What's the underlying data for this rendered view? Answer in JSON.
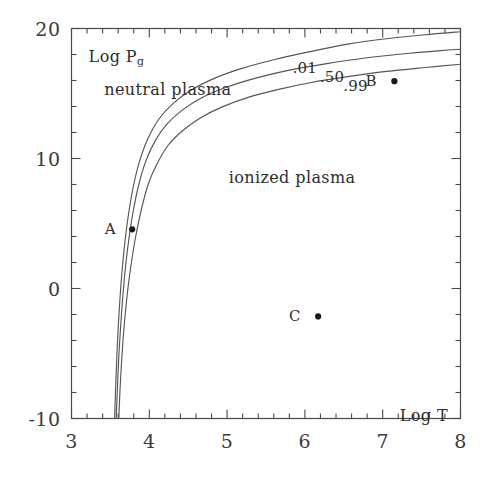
{
  "chart_data": {
    "type": "line",
    "title": "",
    "xlabel": "Log T",
    "ylabel": "Log P_g",
    "xlim": [
      3,
      8
    ],
    "ylim": [
      -10,
      20
    ],
    "grid": false,
    "legend_position": "inline-curve-labels",
    "x_ticks": [
      "3",
      "4",
      "5",
      "6",
      "7",
      "8"
    ],
    "x_tick_values": [
      3,
      4,
      5,
      6,
      7,
      8
    ],
    "x_minor_step": 0.2,
    "y_ticks": [
      "20",
      "10",
      "0",
      "-10"
    ],
    "y_tick_values": [
      20,
      10,
      0,
      -10
    ],
    "y_minor_step": 2,
    "series": [
      {
        "name": ".01",
        "label": ".01",
        "label_x": 6.0,
        "label_y": 16.95,
        "points": [
          [
            3.555,
            -10.0
          ],
          [
            3.565,
            -8.0
          ],
          [
            3.578,
            -6.0
          ],
          [
            3.592,
            -4.0
          ],
          [
            3.61,
            -2.0
          ],
          [
            3.632,
            0.0
          ],
          [
            3.66,
            2.0
          ],
          [
            3.695,
            4.0
          ],
          [
            3.74,
            6.0
          ],
          [
            3.8,
            8.0
          ],
          [
            3.875,
            9.8
          ],
          [
            3.98,
            11.5
          ],
          [
            4.12,
            13.0
          ],
          [
            4.3,
            14.2
          ],
          [
            4.55,
            15.3
          ],
          [
            4.85,
            16.2
          ],
          [
            5.2,
            16.95
          ],
          [
            5.6,
            17.6
          ],
          [
            6.05,
            18.2
          ],
          [
            6.55,
            18.8
          ],
          [
            7.1,
            19.25
          ],
          [
            7.6,
            19.55
          ],
          [
            8.0,
            19.75
          ]
        ]
      },
      {
        "name": ".50",
        "label": ".50",
        "label_x": 6.35,
        "label_y": 16.25,
        "points": [
          [
            3.575,
            -10.0
          ],
          [
            3.588,
            -8.0
          ],
          [
            3.602,
            -6.0
          ],
          [
            3.62,
            -4.0
          ],
          [
            3.642,
            -2.0
          ],
          [
            3.668,
            0.0
          ],
          [
            3.7,
            2.0
          ],
          [
            3.742,
            4.0
          ],
          [
            3.795,
            6.0
          ],
          [
            3.865,
            8.0
          ],
          [
            3.955,
            9.8
          ],
          [
            4.07,
            11.3
          ],
          [
            4.22,
            12.6
          ],
          [
            4.42,
            13.7
          ],
          [
            4.68,
            14.7
          ],
          [
            5.0,
            15.5
          ],
          [
            5.38,
            16.2
          ],
          [
            5.8,
            16.8
          ],
          [
            6.28,
            17.3
          ],
          [
            6.8,
            17.75
          ],
          [
            7.35,
            18.1
          ],
          [
            7.75,
            18.3
          ],
          [
            8.0,
            18.4
          ]
        ]
      },
      {
        "name": ".99",
        "label": ".99",
        "label_x": 6.65,
        "label_y": 15.55,
        "points": [
          [
            3.608,
            -10.0
          ],
          [
            3.622,
            -8.0
          ],
          [
            3.64,
            -6.0
          ],
          [
            3.662,
            -4.0
          ],
          [
            3.69,
            -2.0
          ],
          [
            3.725,
            0.0
          ],
          [
            3.77,
            2.0
          ],
          [
            3.825,
            4.0
          ],
          [
            3.895,
            6.0
          ],
          [
            3.985,
            8.0
          ],
          [
            4.1,
            9.6
          ],
          [
            4.24,
            11.0
          ],
          [
            4.42,
            12.1
          ],
          [
            4.65,
            13.1
          ],
          [
            4.93,
            13.95
          ],
          [
            5.27,
            14.7
          ],
          [
            5.65,
            15.3
          ],
          [
            6.08,
            15.85
          ],
          [
            6.55,
            16.3
          ],
          [
            7.05,
            16.7
          ],
          [
            7.55,
            17.0
          ],
          [
            8.0,
            17.25
          ]
        ]
      }
    ],
    "annotations": [
      {
        "id": "neutral-plasma",
        "text": "neutral plasma",
        "x": 3.42,
        "y": 16.05
      },
      {
        "id": "ionized-plasma",
        "text": "ionized plasma",
        "x": 5.02,
        "y": 9.25
      },
      {
        "id": "y-axis-title",
        "text": "Log P",
        "subscript": "g",
        "x": 3.22,
        "y": 18.6
      },
      {
        "id": "x-axis-title",
        "text": "Log T",
        "x": 7.22,
        "y": -9.05
      }
    ],
    "points": [
      {
        "label": "A",
        "x": 3.78,
        "y": 4.55,
        "label_offset_x": -0.28
      },
      {
        "label": "B",
        "x": 7.15,
        "y": 15.95,
        "label_offset_x": -0.3
      },
      {
        "label": "C",
        "x": 6.17,
        "y": -2.15,
        "label_offset_x": -0.3
      }
    ],
    "colors": {
      "axis": "#4a4a4a",
      "curve": "#555555",
      "text": "#2d2d2d",
      "marker": "#1a1a1a",
      "background": "#ffffff"
    }
  }
}
